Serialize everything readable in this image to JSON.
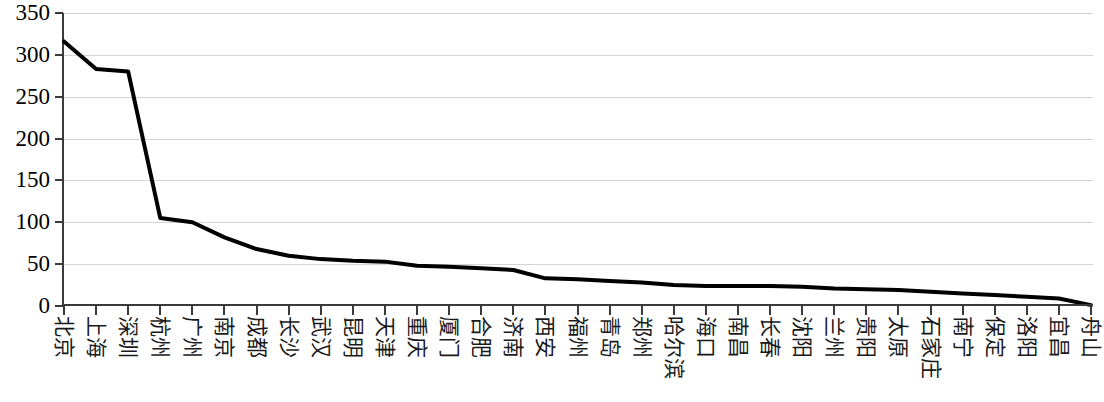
{
  "chart_data": {
    "type": "line",
    "title": "",
    "subtitle": "",
    "xlabel": "",
    "ylabel": "",
    "ylim": [
      0,
      350
    ],
    "ytick_values": [
      0,
      50,
      100,
      150,
      200,
      250,
      300,
      350
    ],
    "ytick_labels": [
      "0",
      "50",
      "100",
      "150",
      "200",
      "250",
      "300",
      "350"
    ],
    "grid": true,
    "legend": false,
    "legend_position": "none",
    "line_color": "#000000",
    "line_width": 4,
    "categories": [
      "北京",
      "上海",
      "深圳",
      "杭州",
      "广州",
      "南京",
      "成都",
      "长沙",
      "武汉",
      "昆明",
      "天津",
      "重庆",
      "厦门",
      "合肥",
      "济南",
      "西安",
      "福州",
      "青岛",
      "郑州",
      "哈尔滨",
      "海口",
      "南昌",
      "长春",
      "沈阳",
      "兰州",
      "贵阳",
      "太原",
      "石家庄",
      "南宁",
      "保定",
      "洛阳",
      "宜昌",
      "舟山"
    ],
    "values": [
      316,
      283,
      280,
      105,
      100,
      82,
      68,
      60,
      56,
      54,
      53,
      48,
      47,
      45,
      43,
      33,
      32,
      30,
      28,
      25,
      24,
      24,
      24,
      23,
      21,
      20,
      19,
      17,
      15,
      13,
      11,
      9,
      1
    ]
  }
}
